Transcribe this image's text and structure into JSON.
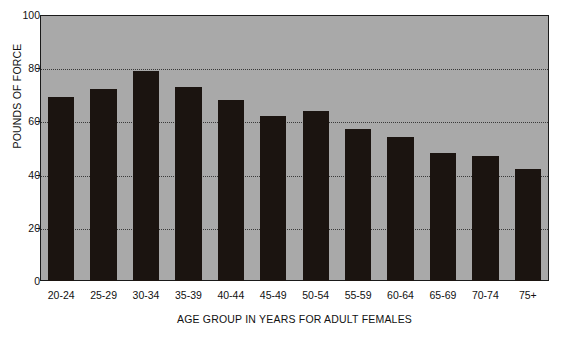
{
  "chart_data": {
    "type": "bar",
    "title": "",
    "xlabel": "AGE GROUP IN YEARS FOR ADULT FEMALES",
    "ylabel": "POUNDS OF FORCE",
    "categories": [
      "20-24",
      "25-29",
      "30-34",
      "35-39",
      "40-44",
      "45-49",
      "50-54",
      "55-59",
      "60-64",
      "65-69",
      "70-74",
      "75+"
    ],
    "values": [
      69,
      72,
      79,
      73,
      68,
      62,
      64,
      57,
      54,
      48,
      47,
      42
    ],
    "ylim": [
      0,
      100
    ],
    "yticks": [
      0,
      20,
      40,
      60,
      80,
      100
    ],
    "ytick_labels": [
      "0",
      "20",
      "40",
      "60",
      "80",
      "100"
    ],
    "grid": true,
    "gridlines_at": [
      20,
      40,
      60,
      80
    ],
    "legend": "none",
    "colors": {
      "bar": "#1b1410",
      "plot_background": "#a9a9a9",
      "frame": "#1a1a1a",
      "gridline": "#3a3a3a",
      "text": "#111111",
      "page_background": "#ffffff"
    }
  }
}
